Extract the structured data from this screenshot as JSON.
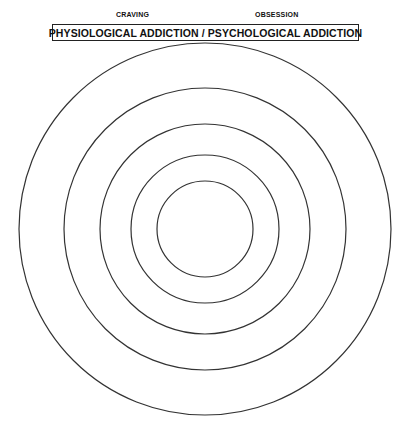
{
  "labels": {
    "left": "CRAVING",
    "right": "OBSESSION"
  },
  "title": "PHYSIOLOGICAL ADDICTION / PSYCHOLOGICAL ADDICTION",
  "diagram": {
    "type": "concentric-circles",
    "center": [
      205,
      229
    ],
    "radii": [
      186,
      141,
      105,
      74,
      48
    ],
    "stroke_color": "#333333",
    "ring_labels": []
  }
}
